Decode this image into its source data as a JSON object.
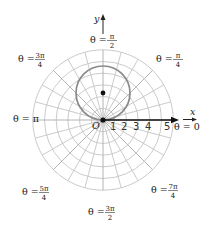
{
  "diagram": {
    "type": "polar-grid-plot",
    "origin_px": [
      103,
      120
    ],
    "ring_spacing_px": 11.7,
    "ring_count": 6,
    "spoke_step_deg": 15,
    "colors": {
      "grid": "#c4c4c4",
      "curve": "#8a8a8a",
      "axis": "#111111",
      "text": "#222222"
    },
    "curve": {
      "shape": "circle",
      "center_px": [
        103,
        93
      ],
      "radius_px": 27,
      "center_dot": true
    },
    "axes": {
      "x_label": "x",
      "y_label": "y",
      "origin_label": "O"
    },
    "ticks": [
      "1",
      "2",
      "3",
      "4",
      "5"
    ],
    "angle_labels": {
      "theta_0": {
        "prefix": "θ = ",
        "text": "0"
      },
      "theta_pi_4": {
        "prefix": "θ = ",
        "num": "π",
        "den": "4"
      },
      "theta_pi_2": {
        "prefix": "θ = ",
        "num": "π",
        "den": "2"
      },
      "theta_3pi_4": {
        "prefix": "θ = ",
        "num": "3π",
        "den": "4"
      },
      "theta_pi": {
        "prefix": "θ = ",
        "text": "π"
      },
      "theta_5pi_4": {
        "prefix": "θ = ",
        "num": "5π",
        "den": "4"
      },
      "theta_3pi_2": {
        "prefix": "θ = ",
        "num": "3π",
        "den": "2"
      },
      "theta_7pi_4": {
        "prefix": "θ = ",
        "num": "7π",
        "den": "4"
      }
    }
  }
}
